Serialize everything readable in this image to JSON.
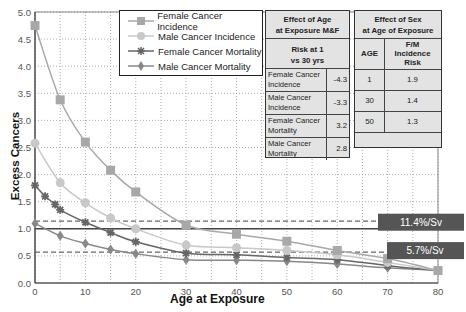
{
  "chart_data": {
    "type": "line",
    "title": "",
    "xlabel": "Age at Exposure",
    "ylabel": "Excess Cancers",
    "xlim": [
      0,
      80
    ],
    "ylim": [
      0,
      5.0
    ],
    "x_ticks": [
      "0",
      "10",
      "20",
      "30",
      "40",
      "50",
      "60",
      "70",
      "80"
    ],
    "y_ticks": [
      "0.0",
      "0.5",
      "1.0",
      "1.5",
      "2.0",
      "2.5",
      "3.0",
      "3.5",
      "4.0",
      "4.5",
      "5.0"
    ],
    "grid": true,
    "legend_position": "top-left-inside",
    "series": [
      {
        "name": "Female Cancer Incidence",
        "marker": "square",
        "color": "#a8a8a8",
        "x": [
          0,
          5,
          10,
          15,
          20,
          30,
          40,
          50,
          60,
          70,
          80
        ],
        "y": [
          4.75,
          3.38,
          2.6,
          2.08,
          1.68,
          1.07,
          0.9,
          0.77,
          0.6,
          0.45,
          0.23
        ]
      },
      {
        "name": "Male Cancer Incidence",
        "marker": "circle",
        "color": "#c8c8c8",
        "x": [
          0,
          5,
          10,
          15,
          20,
          30,
          40,
          50,
          60,
          70,
          80
        ],
        "y": [
          2.58,
          1.85,
          1.48,
          1.2,
          1.0,
          0.7,
          0.65,
          0.6,
          0.52,
          0.38,
          0.23
        ]
      },
      {
        "name": "Female Cancer Mortality",
        "marker": "star",
        "color": "#666666",
        "x": [
          0,
          2,
          4,
          5,
          10,
          15,
          20,
          30,
          40,
          50,
          60,
          70,
          80
        ],
        "y": [
          1.8,
          1.6,
          1.45,
          1.35,
          1.12,
          0.93,
          0.76,
          0.55,
          0.52,
          0.47,
          0.43,
          0.32,
          0.23
        ]
      },
      {
        "name": "Male Cancer Mortality",
        "marker": "diamond",
        "color": "#888888",
        "x": [
          0,
          5,
          10,
          15,
          20,
          30,
          40,
          50,
          60,
          70,
          80
        ],
        "y": [
          1.1,
          0.87,
          0.73,
          0.62,
          0.54,
          0.43,
          0.42,
          0.4,
          0.35,
          0.28,
          0.23
        ]
      }
    ],
    "reference_lines": [
      {
        "y": 1.0,
        "style": "solid",
        "color": "#444444"
      },
      {
        "y": 1.14,
        "style": "dashed",
        "label": "11.4%/Sv",
        "color": "#666666"
      },
      {
        "y": 0.57,
        "style": "dashed",
        "label": "5.7%/Sv",
        "color": "#666666"
      }
    ]
  },
  "legend": {
    "items": [
      {
        "label": "Female Cancer Incidence"
      },
      {
        "label": "Male Cancer Incidence"
      },
      {
        "label": "Female Cancer Mortality"
      },
      {
        "label": "Male Cancer Mortality"
      }
    ]
  },
  "table_age": {
    "title_line1": "Effect of Age",
    "title_line2": "at Exposure M&F",
    "subheader_line1": "Risk at 1",
    "subheader_line2": "vs 30 yrs",
    "rows": [
      {
        "label_line1": "Female Cancer",
        "label_line2": "Incidence",
        "value": "-4.3"
      },
      {
        "label_line1": "Male Cancer",
        "label_line2": "Incidence",
        "value": "-3.3"
      },
      {
        "label_line1": "Female Cancer",
        "label_line2": "Mortality",
        "value": "3.2"
      },
      {
        "label_line1": "Male Cancer",
        "label_line2": "Mortality",
        "value": "2.8"
      }
    ]
  },
  "table_sex": {
    "title_line1": "Effect of Sex",
    "title_line2": "at Age of Exposure",
    "col_age": "AGE",
    "col_risk_line1": "F/M",
    "col_risk_line2": "Incidence",
    "col_risk_line3": "Risk",
    "rows": [
      {
        "age": "1",
        "risk": "1.9"
      },
      {
        "age": "30",
        "risk": "1.4"
      },
      {
        "age": "50",
        "risk": "1.3"
      }
    ]
  },
  "badges": {
    "high": "11.4%/Sv",
    "low": "5.7%/Sv"
  }
}
